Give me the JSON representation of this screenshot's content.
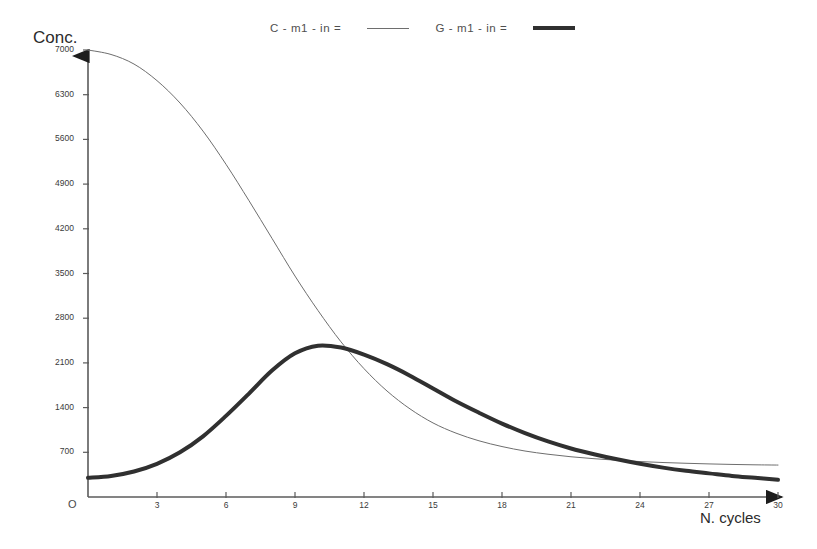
{
  "chart_data": {
    "type": "line",
    "title": "",
    "xlabel": "N. cycles",
    "ylabel": "Conc.",
    "origin_label": "O",
    "xlim": [
      0,
      30
    ],
    "ylim": [
      0,
      7000
    ],
    "grid": false,
    "legend_position": "top",
    "x_ticks": [
      0,
      3,
      6,
      9,
      12,
      15,
      18,
      21,
      24,
      27,
      30
    ],
    "x_tick_labels": [
      "0",
      "3",
      "6",
      "9",
      "12",
      "15",
      "18",
      "21",
      "24",
      "27",
      "30"
    ],
    "y_ticks": [
      700,
      1400,
      2100,
      2800,
      3500,
      4200,
      4900,
      5600,
      6300,
      7000
    ],
    "y_tick_labels": [
      "700",
      "1400",
      "2100",
      "2800",
      "3500",
      "4200",
      "4900",
      "5600",
      "6300",
      "7000"
    ],
    "x": [
      0,
      1,
      2,
      3,
      4,
      5,
      6,
      7,
      8,
      9,
      10,
      11,
      12,
      13,
      14,
      15,
      16,
      17,
      18,
      19,
      20,
      21,
      22,
      23,
      24,
      25,
      26,
      27,
      28,
      29,
      30
    ],
    "series": [
      {
        "name": "C - m1 - in =",
        "style": "thin",
        "color": "#6e6e6e",
        "line_width": 1,
        "values": [
          7000,
          6930,
          6780,
          6520,
          6170,
          5730,
          5210,
          4640,
          4050,
          3460,
          2920,
          2430,
          2010,
          1660,
          1380,
          1160,
          1000,
          880,
          790,
          720,
          670,
          630,
          600,
          575,
          555,
          540,
          528,
          518,
          510,
          504,
          500
        ]
      },
      {
        "name": "G - m1 - in =",
        "style": "thick",
        "color": "#303030",
        "line_width": 4,
        "values": [
          300,
          330,
          400,
          520,
          700,
          950,
          1270,
          1620,
          1980,
          2250,
          2370,
          2340,
          2230,
          2080,
          1900,
          1700,
          1500,
          1320,
          1150,
          1000,
          870,
          760,
          670,
          590,
          520,
          460,
          410,
          370,
          330,
          300,
          270
        ]
      }
    ],
    "legend": [
      {
        "label": "C - m1 - in =",
        "swatch": "thin-line"
      },
      {
        "label": "G - m1 - in =",
        "swatch": "thick-line"
      }
    ]
  }
}
